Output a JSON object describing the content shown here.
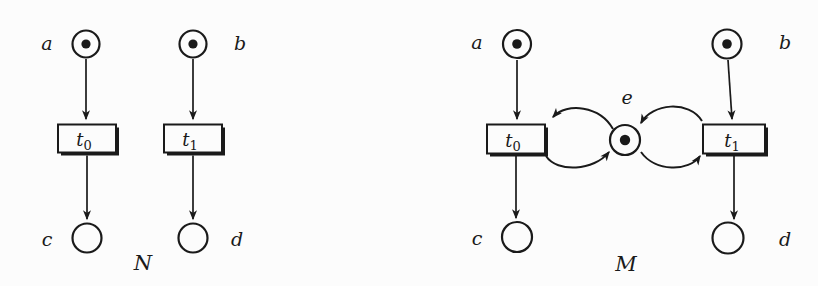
{
  "figure": {
    "background": "#fcfcfc",
    "ink": "#1a1a1a",
    "type": "petri-nets"
  },
  "net_n": {
    "name": "N",
    "place_a": "a",
    "place_b": "b",
    "place_c": "c",
    "place_d": "d",
    "t0_base": "t",
    "t0_sub": "0",
    "t1_base": "t",
    "t1_sub": "1",
    "marking": [
      "a",
      "b"
    ],
    "arcs": [
      "a→t0",
      "t0→c",
      "b→t1",
      "t1→d"
    ]
  },
  "net_m": {
    "name": "M",
    "place_a": "a",
    "place_b": "b",
    "place_c": "c",
    "place_d": "d",
    "place_e": "e",
    "t0_base": "t",
    "t0_sub": "0",
    "t1_base": "t",
    "t1_sub": "1",
    "marking": [
      "a",
      "b",
      "e"
    ],
    "arcs": [
      "a→t0",
      "t0→c",
      "b→t1",
      "t1→d",
      "e→t0",
      "t0→e",
      "e→t1",
      "t1→e"
    ]
  }
}
